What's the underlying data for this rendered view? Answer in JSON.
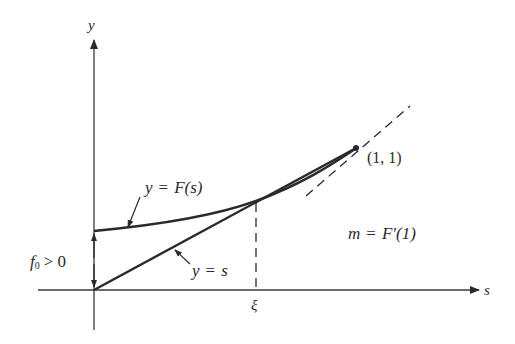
{
  "figure": {
    "axes": {
      "x_label": "s",
      "y_label": "y",
      "origin_px": [
        94,
        290
      ]
    },
    "curves": [
      {
        "name": "F-curve",
        "label": "y = F(s)",
        "label_parts": {
          "lhs": "y",
          "eq": "=",
          "rhs": "F(s)"
        },
        "style": "solid"
      },
      {
        "name": "diagonal",
        "label": "y = s",
        "label_parts": {
          "lhs": "y",
          "eq": "=",
          "rhs": "s"
        },
        "style": "solid"
      },
      {
        "name": "tangent-at-1",
        "label": "m = F′(1)",
        "label_parts": {
          "lhs": "m",
          "eq": "=",
          "rhs": "F′(1)"
        },
        "style": "dashed"
      }
    ],
    "points": {
      "fixed_point_label": "(1, 1)",
      "xi_label": "ξ"
    },
    "annotations": {
      "intercept_label": "f₀ > 0",
      "intercept_parts": {
        "f": "f",
        "sub": "0",
        "rel": "> 0"
      }
    },
    "colors": {
      "ink": "#2a2a2a",
      "background": "#ffffff"
    }
  }
}
